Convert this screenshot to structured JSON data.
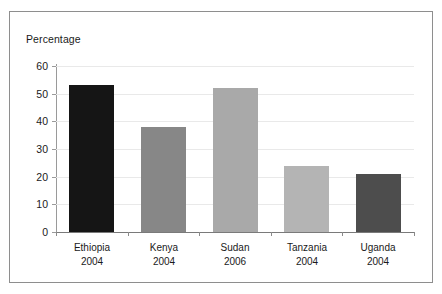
{
  "chart_data": {
    "type": "bar",
    "title": "",
    "subtitle": "",
    "ylabel": "Percentage",
    "xlabel": "",
    "categories": [
      "Ethiopia",
      "Kenya",
      "Sudan",
      "Tanzania",
      "Uganda"
    ],
    "category_years": [
      "2004",
      "2004",
      "2006",
      "2004",
      "2004"
    ],
    "values": [
      53,
      38,
      52,
      24,
      21
    ],
    "ylim": [
      0,
      60
    ],
    "ytick_labels": [
      "0",
      "10",
      "20",
      "30",
      "40",
      "50",
      "60"
    ],
    "ytick_values": [
      0,
      10,
      20,
      30,
      40,
      50,
      60
    ],
    "grid": true,
    "legend": "none",
    "bar_colors": [
      "#151515",
      "#878787",
      "#a9a9a9",
      "#b4b4b4",
      "#4d4d4d"
    ]
  },
  "axes": {
    "y_title": "Percentage"
  },
  "colors": {
    "frame": "#8e8e8e",
    "gridline": "#e9e9e9",
    "axis": "#8a8a8a",
    "text": "#1a1a1a",
    "background": "#ffffff"
  }
}
